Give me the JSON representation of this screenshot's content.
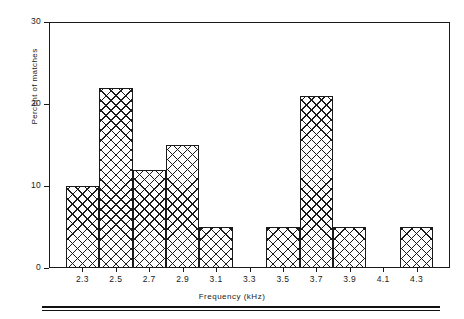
{
  "chart_data": {
    "type": "bar",
    "title": "",
    "subtitle": "",
    "xlabel": "Frequency (kHz)",
    "ylabel": "Percent of matches",
    "categories": [
      "2.3",
      "2.5",
      "2.7",
      "2.9",
      "3.1",
      "3.3",
      "3.5",
      "3.7",
      "3.9",
      "4.1",
      "4.3"
    ],
    "values": [
      10,
      22,
      12,
      15,
      5,
      0,
      5,
      21,
      5,
      0,
      5
    ],
    "xlim": [
      2.2,
      4.4
    ],
    "ylim": [
      0,
      30
    ],
    "ytick_values": [
      0,
      10,
      20,
      30
    ],
    "ytick_labels": [
      "0",
      "10",
      "20",
      "30"
    ],
    "xtick_labels": [
      "2.3",
      "2.5",
      "2.7",
      "2.9",
      "3.1",
      "3.3",
      "3.5",
      "3.7",
      "3.9",
      "4.1",
      "4.3"
    ],
    "grid": false,
    "legend": null,
    "bar_style": "crosshatch",
    "bin_width": 0.2,
    "colors": {
      "axis": "#1a1a1a",
      "bar_edge": "#1a1a1a",
      "bar_fill": "#ffffff",
      "hatch": "#1a1a1a"
    },
    "annotations": []
  }
}
